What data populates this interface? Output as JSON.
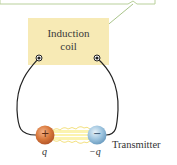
{
  "diagram": {
    "coil": {
      "line1": "Induction",
      "line2": "coil",
      "fill": "#f7eab5"
    },
    "transmitter_label": "Transmitter",
    "charges": [
      {
        "symbol": "+",
        "label": "q",
        "color": "#d8773a"
      },
      {
        "symbol": "−",
        "label": "−q",
        "color": "#9cc3de"
      }
    ],
    "callout_color": "#a9c48a",
    "wire_color": "#222222"
  }
}
